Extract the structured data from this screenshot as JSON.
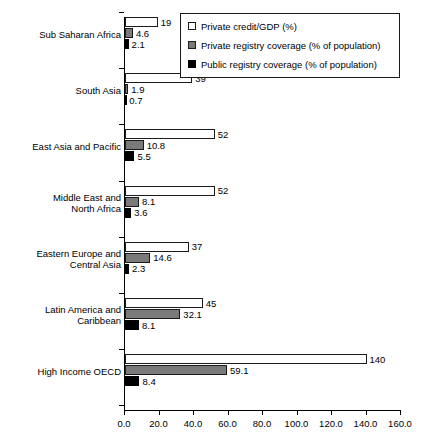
{
  "chart_data": {
    "type": "bar",
    "orientation": "horizontal",
    "title": "",
    "xlabel": "",
    "ylabel": "",
    "xlim": [
      0,
      160
    ],
    "xticks": [
      "0.0",
      "20.0",
      "40.0",
      "60.0",
      "80.0",
      "100.0",
      "120.0",
      "140.0",
      "160.0"
    ],
    "xtick_values": [
      0,
      20,
      40,
      60,
      80,
      100,
      120,
      140,
      160
    ],
    "grid": false,
    "legend_position": "top-right",
    "categories": [
      "Sub Saharan Africa",
      "South Asia",
      "East Asia and Pacific",
      "Middle East and\nNorth Africa",
      "Eastern Europe and\nCentral Asia",
      "Latin America and\nCaribbean",
      "High Income OECD"
    ],
    "series": [
      {
        "name": "Private credit/GDP (%)",
        "color": "#ffffff",
        "values": [
          19,
          39,
          52,
          52,
          37,
          45,
          140
        ],
        "labels": [
          "19",
          "39",
          "52",
          "52",
          "37",
          "45",
          "140"
        ]
      },
      {
        "name": "Private registry coverage (% of population)",
        "color": "#7a7a7a",
        "values": [
          4.6,
          1.9,
          10.8,
          8.1,
          14.6,
          32.1,
          59.1
        ],
        "labels": [
          "4.6",
          "1.9",
          "10.8",
          "8.1",
          "14.6",
          "32.1",
          "59.1"
        ]
      },
      {
        "name": "Public registry coverage (% of population)",
        "color": "#000000",
        "values": [
          2.1,
          0.7,
          5.5,
          3.6,
          2.3,
          8.1,
          8.4
        ],
        "labels": [
          "2.1",
          "0.7",
          "5.5",
          "3.6",
          "2.3",
          "8.1",
          "8.4"
        ]
      }
    ]
  },
  "legend": {
    "items": [
      {
        "label": "Private credit/GDP (%)",
        "swatch": "white-square-icon"
      },
      {
        "label": "Private registry coverage (% of population)",
        "swatch": "gray-square-icon"
      },
      {
        "label": "Public registry coverage (% of population)",
        "swatch": "black-square-icon"
      }
    ]
  }
}
